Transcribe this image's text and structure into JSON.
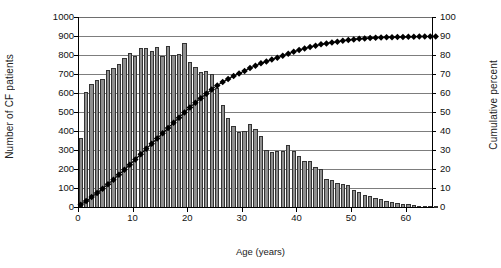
{
  "chart_data": {
    "type": "bar",
    "title": "",
    "xlabel": "Age (years)",
    "ylabel": "Number of CF patients",
    "y2label": "Cumulative percent",
    "xlim": [
      0,
      65
    ],
    "ylim": [
      0,
      1000
    ],
    "y2lim": [
      0,
      100
    ],
    "grid": true,
    "legend": null,
    "bar_color": "#8f8f8f",
    "bar_edge_color": "#333333",
    "line_color": "#000000",
    "marker": "diamond",
    "x_ticks": [
      0,
      10,
      20,
      30,
      40,
      50,
      60
    ],
    "y_ticks": [
      0,
      100,
      200,
      300,
      400,
      500,
      600,
      700,
      800,
      900,
      1000
    ],
    "y2_ticks": [
      0,
      10,
      20,
      30,
      40,
      50,
      60,
      70,
      80,
      90,
      100
    ],
    "categories": [
      0,
      1,
      2,
      3,
      4,
      5,
      6,
      7,
      8,
      9,
      10,
      11,
      12,
      13,
      14,
      15,
      16,
      17,
      18,
      19,
      20,
      21,
      22,
      23,
      24,
      25,
      26,
      27,
      28,
      29,
      30,
      31,
      32,
      33,
      34,
      35,
      36,
      37,
      38,
      39,
      40,
      41,
      42,
      43,
      44,
      45,
      46,
      47,
      48,
      49,
      50,
      51,
      52,
      53,
      54,
      55,
      56,
      57,
      58,
      59,
      60,
      61,
      62,
      63,
      64,
      65
    ],
    "series": [
      {
        "name": "Number of CF patients",
        "axis": "left",
        "values": [
          370,
          610,
          655,
          675,
          680,
          725,
          735,
          760,
          790,
          815,
          800,
          840,
          840,
          825,
          845,
          800,
          855,
          805,
          810,
          870,
          770,
          740,
          715,
          720,
          705,
          630,
          540,
          475,
          430,
          400,
          405,
          440,
          415,
          380,
          305,
          295,
          300,
          300,
          330,
          300,
          275,
          250,
          250,
          215,
          205,
          155,
          150,
          130,
          125,
          120,
          95,
          85,
          70,
          65,
          55,
          45,
          35,
          30,
          25,
          20,
          20,
          15,
          12,
          10,
          8,
          6
        ]
      },
      {
        "name": "Cumulative percent",
        "axis": "right",
        "values": [
          1.0,
          2.6,
          4.4,
          6.3,
          8.1,
          10.1,
          12.1,
          14.2,
          16.3,
          18.5,
          20.7,
          23.0,
          25.3,
          27.5,
          29.8,
          32.0,
          34.3,
          36.5,
          38.7,
          41.0,
          43.1,
          45.1,
          47.1,
          49.0,
          50.9,
          52.6,
          54.1,
          55.4,
          56.6,
          57.7,
          58.8,
          60.0,
          61.2,
          62.2,
          63.0,
          63.8,
          64.6,
          65.5,
          66.4,
          67.2,
          68.0,
          68.7,
          69.4,
          70.0,
          70.6,
          71.0,
          71.4,
          71.8,
          72.1,
          72.4,
          72.7,
          72.9,
          73.1,
          73.3,
          73.4,
          73.5,
          73.6,
          73.7,
          73.7,
          73.8,
          73.8,
          73.9,
          73.9,
          73.9,
          74.0,
          74.0
        ]
      }
    ],
    "cumulative_plotted": [
      1.2,
      3.1,
      5.2,
      7.4,
      9.6,
      12.0,
      14.4,
      17.0,
      19.6,
      22.3,
      25.0,
      27.8,
      30.6,
      33.3,
      36.1,
      38.8,
      41.6,
      44.3,
      47.0,
      49.8,
      52.4,
      54.9,
      57.3,
      59.6,
      61.9,
      64.0,
      65.8,
      67.4,
      68.9,
      70.2,
      71.6,
      73.1,
      74.4,
      75.6,
      76.6,
      77.6,
      78.6,
      79.6,
      80.7,
      81.7,
      82.6,
      83.4,
      84.2,
      84.9,
      85.6,
      86.1,
      86.6,
      87.0,
      87.5,
      87.9,
      88.2,
      88.5,
      88.7,
      88.9,
      89.1,
      89.2,
      89.3,
      89.4,
      89.5,
      89.5,
      89.6,
      89.6,
      89.7,
      89.7,
      89.7,
      89.8
    ]
  },
  "axes": {
    "y_left_labels": [
      "1000",
      "900",
      "800",
      "700",
      "600",
      "500",
      "400",
      "300",
      "200",
      "100",
      "0"
    ],
    "y_right_labels": [
      "100",
      "90",
      "80",
      "70",
      "60",
      "50",
      "40",
      "30",
      "20",
      "10",
      "0"
    ],
    "x_labels": [
      "0",
      "10",
      "20",
      "30",
      "40",
      "50",
      "60"
    ]
  },
  "labels": {
    "y_left_title": "Number of CF patients",
    "y_right_title": "Cumulative percent",
    "x_title": "Age (years)"
  }
}
